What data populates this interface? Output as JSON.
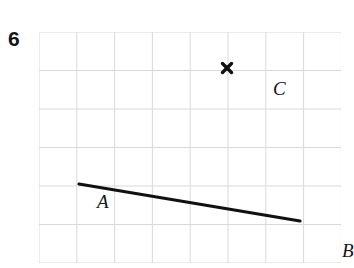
{
  "question": {
    "number": "6"
  },
  "figure": {
    "type": "coordinate-grid-diagram",
    "grid": {
      "columns": 8,
      "rows": 6,
      "cell_width": 37.8,
      "cell_height": 38.5,
      "origin_x": 39,
      "origin_y": 32,
      "width": 302,
      "height": 231,
      "line_color": "#d9d9d9",
      "background_color": "#ffffff"
    },
    "points": [
      {
        "id": "A",
        "label": "A",
        "grid_col": 1,
        "grid_row": 4,
        "x": 40,
        "y": 152,
        "marker": "line-endpoint",
        "label_position": "upper-left"
      },
      {
        "id": "B",
        "label": "B",
        "grid_col": 6.9,
        "grid_row": 4.9,
        "x": 261,
        "y": 189,
        "marker": "line-endpoint",
        "label_position": "right"
      },
      {
        "id": "C",
        "label": "C",
        "grid_col": 5,
        "grid_row": 1,
        "x": 188,
        "y": 36,
        "marker": "x-mark",
        "label_position": "upper-right"
      }
    ],
    "segments": [
      {
        "id": "AB",
        "from": "A",
        "to": "B",
        "x1": 40,
        "y1": 152,
        "x2": 261,
        "y2": 189,
        "stroke_color": "#111111",
        "stroke_width": 3.2
      }
    ],
    "marks": [
      {
        "id": "C-x-mark",
        "shape": "x",
        "x": 188,
        "y": 36,
        "size": 9,
        "stroke_color": "#111111",
        "stroke_width": 3.4
      }
    ]
  }
}
